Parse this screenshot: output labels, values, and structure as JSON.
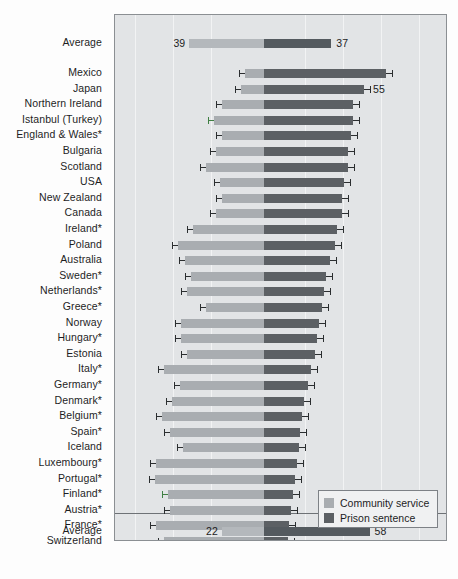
{
  "chart_data": {
    "type": "bar",
    "subtype": "diverging-stacked-bar",
    "title": "",
    "xlabel": "",
    "ylabel": "",
    "grid": true,
    "legend_position": "bottom-right",
    "axis_note": "Back-to-back bars: 'Community service' extends left from centre, 'Prison sentence' extends right from centre. Values are percentages; error bars show confidence intervals.",
    "series": [
      {
        "name": "Community service",
        "color": "#a9adb1",
        "direction": "left"
      },
      {
        "name": "Prison sentence",
        "color": "#5c6064",
        "direction": "right"
      }
    ],
    "categories": [
      "Average",
      "Mexico",
      "Japan",
      "Northern Ireland",
      "Istanbul (Turkey)",
      "England & Wales*",
      "Bulgaria",
      "Scotland",
      "USA",
      "Canada",
      "New Zealand",
      "Ireland*",
      "Poland",
      "Australia",
      "Sweden*",
      "Netherlands*",
      "Greece*",
      "Norway",
      "Hungary*",
      "Estonia",
      "Italy*",
      "Germany*",
      "Denmark*",
      "Belgium*",
      "Spain*",
      "Iceland",
      "Luxembourg*",
      "Portugal*",
      "Finland*",
      "Austria*",
      "France*",
      "Switzerland",
      "Average"
    ],
    "rows": [
      {
        "label": "Average",
        "group": "top-average",
        "community": 39,
        "prison": 37,
        "community_label": "39",
        "prison_label": "37",
        "err": false
      },
      {
        "label": "Mexico",
        "group": "country",
        "community": 10,
        "prison": 67,
        "err": true,
        "err_low_left": 12,
        "err_high_left": 8,
        "err_low_right": 64,
        "err_high_right": 70
      },
      {
        "label": "Japan",
        "group": "country",
        "community": 12,
        "prison": 55,
        "prison_label": "55",
        "err": true
      },
      {
        "label": "Northern Ireland",
        "group": "country",
        "community": 22,
        "prison": 49,
        "err": true
      },
      {
        "label": "Istanbul (Turkey)",
        "group": "country",
        "community": 26,
        "prison": 49,
        "err": true,
        "accent": "green"
      },
      {
        "label": "England & Wales*",
        "group": "country",
        "community": 22,
        "prison": 48,
        "err": true
      },
      {
        "label": "Bulgaria",
        "group": "country",
        "community": 25,
        "prison": 46,
        "err": true
      },
      {
        "label": "Scotland",
        "group": "country",
        "community": 30,
        "prison": 46,
        "err": true
      },
      {
        "label": "USA",
        "group": "country",
        "community": 23,
        "prison": 44,
        "err": true
      },
      {
        "label": "New Zealand",
        "group": "country",
        "community": 22,
        "prison": 43,
        "err": true
      },
      {
        "label": "Canada",
        "group": "country",
        "community": 25,
        "prison": 43,
        "err": true
      },
      {
        "label": "Ireland*",
        "group": "country",
        "community": 37,
        "prison": 40,
        "err": true
      },
      {
        "label": "Poland",
        "group": "country",
        "community": 45,
        "prison": 39,
        "err": true
      },
      {
        "label": "Australia",
        "group": "country",
        "community": 41,
        "prison": 36,
        "err": true
      },
      {
        "label": "Sweden*",
        "group": "country",
        "community": 38,
        "prison": 34,
        "err": true
      },
      {
        "label": "Netherlands*",
        "group": "country",
        "community": 40,
        "prison": 33,
        "err": true
      },
      {
        "label": "Greece*",
        "group": "country",
        "community": 30,
        "prison": 32,
        "err": true
      },
      {
        "label": "Norway",
        "group": "country",
        "community": 43,
        "prison": 30,
        "err": true
      },
      {
        "label": "Hungary*",
        "group": "country",
        "community": 43,
        "prison": 29,
        "err": true
      },
      {
        "label": "Estonia",
        "group": "country",
        "community": 40,
        "prison": 28,
        "err": true
      },
      {
        "label": "Italy*",
        "group": "country",
        "community": 52,
        "prison": 26,
        "err": true
      },
      {
        "label": "Germany*",
        "group": "country",
        "community": 44,
        "prison": 24,
        "err": true
      },
      {
        "label": "Denmark*",
        "group": "country",
        "community": 48,
        "prison": 22,
        "err": true
      },
      {
        "label": "Belgium*",
        "group": "country",
        "community": 53,
        "prison": 21,
        "err": true
      },
      {
        "label": "Spain*",
        "group": "country",
        "community": 49,
        "prison": 20,
        "err": true
      },
      {
        "label": "Iceland",
        "group": "country",
        "community": 42,
        "prison": 19,
        "err": true
      },
      {
        "label": "Luxembourg*",
        "group": "country",
        "community": 56,
        "prison": 18,
        "err": true
      },
      {
        "label": "Portugal*",
        "group": "country",
        "community": 57,
        "prison": 17,
        "err": true
      },
      {
        "label": "Finland*",
        "group": "country",
        "community": 50,
        "prison": 16,
        "err": true,
        "accent": "green"
      },
      {
        "label": "Austria*",
        "group": "country",
        "community": 49,
        "prison": 15,
        "err": true
      },
      {
        "label": "France*",
        "group": "country",
        "community": 56,
        "prison": 14,
        "err": true
      },
      {
        "label": "Switzerland",
        "group": "country",
        "community": 52,
        "prison": 13,
        "err": true
      },
      {
        "label": "Average",
        "group": "bottom-average",
        "community": 22,
        "prison": 58,
        "community_label": "22",
        "prison_label": "58",
        "err": false
      }
    ]
  },
  "legend": {
    "items": [
      {
        "label": "Community service",
        "color": "#a9adb1"
      },
      {
        "label": "Prison sentence",
        "color": "#5c6064"
      }
    ]
  },
  "colors": {
    "community_service": "#a9adb1",
    "prison_sentence": "#5c6064",
    "plot_background": "#e2e4e6",
    "frame_border": "#8b8f93",
    "error_bar": "#2b2e30",
    "accent_green": "#3f7f43"
  }
}
